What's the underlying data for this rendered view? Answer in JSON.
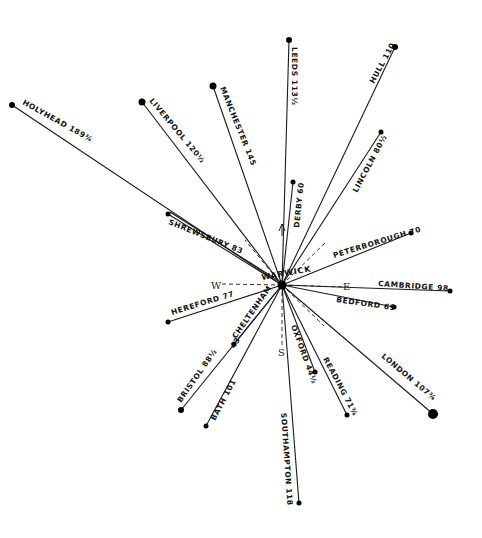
{
  "diagram": {
    "hub": {
      "name": "WARWICK",
      "x": 282,
      "y": 285
    },
    "compass": {
      "N": "N",
      "S": "S",
      "E": "E",
      "W": "W"
    },
    "destinations": [
      {
        "name": "HOLYHEAD",
        "distance": "189¾",
        "x": 12,
        "y": 105,
        "dot": 3
      },
      {
        "name": "LIVERPOOL",
        "distance": "120½",
        "x": 142,
        "y": 102,
        "dot": 3.5
      },
      {
        "name": "MANCHESTER",
        "distance": "145",
        "x": 213,
        "y": 86,
        "dot": 3.5
      },
      {
        "name": "LEEDS",
        "distance": "113½",
        "x": 289,
        "y": 40,
        "dot": 3
      },
      {
        "name": "HULL",
        "distance": "110",
        "x": 395,
        "y": 47,
        "dot": 3
      },
      {
        "name": "LINCOLN",
        "distance": "80½",
        "x": 381,
        "y": 132,
        "dot": 2.5
      },
      {
        "name": "DERBY",
        "distance": "60",
        "x": 293,
        "y": 182,
        "dot": 2.5
      },
      {
        "name": "PETERBOROUGH",
        "distance": "70",
        "x": 411,
        "y": 233,
        "dot": 2.5
      },
      {
        "name": "CAMBRIDGE",
        "distance": "98",
        "x": 450,
        "y": 291,
        "dot": 2.5
      },
      {
        "name": "BEDFORD",
        "distance": "68",
        "x": 394,
        "y": 307,
        "dot": 2.5
      },
      {
        "name": "LONDON",
        "distance": "107¾",
        "x": 433,
        "y": 414,
        "dot": 5
      },
      {
        "name": "READING",
        "distance": "71¾",
        "x": 347,
        "y": 415,
        "dot": 2.5
      },
      {
        "name": "OXFORD",
        "distance": "44½",
        "x": 315,
        "y": 372,
        "dot": 2.5
      },
      {
        "name": "SOUTHAMPTON",
        "distance": "118",
        "x": 299,
        "y": 503,
        "dot": 2.5
      },
      {
        "name": "BATH",
        "distance": "101",
        "x": 206,
        "y": 426,
        "dot": 2.5
      },
      {
        "name": "BRISTOL",
        "distance": "88½",
        "x": 181,
        "y": 410,
        "dot": 3
      },
      {
        "name": "CHELTENHAM",
        "distance": "43",
        "x": 234,
        "y": 344,
        "dot": 2.5
      },
      {
        "name": "HEREFORD",
        "distance": "77",
        "x": 168,
        "y": 322,
        "dot": 2.5
      },
      {
        "name": "SHREWSBURY",
        "distance": "63",
        "x": 168,
        "y": 214,
        "dot": 2.5
      }
    ],
    "labels": [
      {
        "text": "HOLYHEAD 189¾",
        "x": 22,
        "y": 104,
        "rot": 29
      },
      {
        "text": "LIVERPOOL 120½",
        "x": 149,
        "y": 101,
        "rot": 50
      },
      {
        "text": "MANCHESTER 145",
        "x": 220,
        "y": 88,
        "rot": 68
      },
      {
        "text": "LEEDS 113½",
        "x": 292,
        "y": 47,
        "rot": 90
      },
      {
        "text": "HULL 110",
        "x": 374,
        "y": 84,
        "rot": -62
      },
      {
        "text": "LINCOLN 80½",
        "x": 357,
        "y": 193,
        "rot": -62
      },
      {
        "text": "DERBY 60",
        "x": 299,
        "y": 228,
        "rot": -84
      },
      {
        "text": "PETERBOROUGH 70",
        "x": 334,
        "y": 258,
        "rot": -17
      },
      {
        "text": "CAMBRIDGE 98",
        "x": 378,
        "y": 286,
        "rot": 4
      },
      {
        "text": "BEDFORD 69",
        "x": 336,
        "y": 302,
        "rot": 8
      },
      {
        "text": "LONDON 107¾",
        "x": 381,
        "y": 357,
        "rot": 40
      },
      {
        "text": "READING 71¾",
        "x": 323,
        "y": 359,
        "rot": 62
      },
      {
        "text": "OXFORD 44½",
        "x": 291,
        "y": 326,
        "rot": 70
      },
      {
        "text": "SOUTHAMPTON 118",
        "x": 281,
        "y": 413,
        "rot": 86
      },
      {
        "text": "BATH 101",
        "x": 215,
        "y": 421,
        "rot": -62
      },
      {
        "text": "BRISTOL 88½",
        "x": 181,
        "y": 403,
        "rot": -55
      },
      {
        "text": "CHELTENHAM",
        "x": 236,
        "y": 339,
        "rot": -55
      },
      {
        "text": "43",
        "x": 234,
        "y": 349,
        "rot": -55
      },
      {
        "text": "HEREFORD 77",
        "x": 172,
        "y": 315,
        "rot": -17
      },
      {
        "text": "SHREWSBURY 83",
        "x": 168,
        "y": 224,
        "rot": 22
      }
    ]
  }
}
